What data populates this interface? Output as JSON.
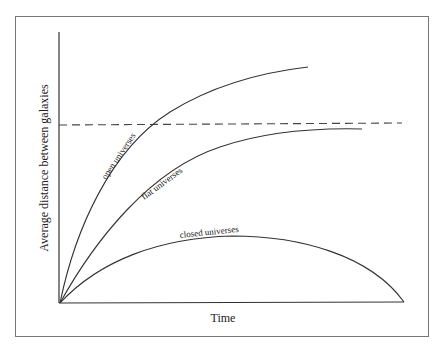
{
  "diagram": {
    "xlabel": "Time",
    "ylabel": "Average distance between galaxies",
    "curves": [
      {
        "name": "open",
        "label": "open universes"
      },
      {
        "name": "flat",
        "label": "flat universes"
      },
      {
        "name": "closed",
        "label": "closed universes"
      }
    ],
    "reference_line": "dashed horizontal line",
    "colors": {
      "line": "#333333",
      "frame": "#777777",
      "background": "#ffffff"
    }
  }
}
